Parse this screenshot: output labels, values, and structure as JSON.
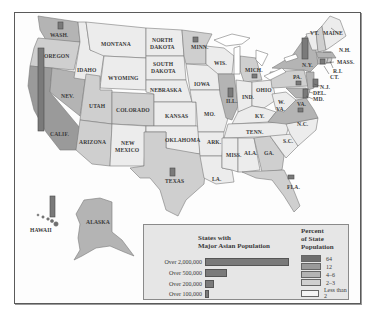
{
  "title": "States with Major Asian Population",
  "colors": {
    "p64": "#6e6e6e",
    "p12": "#9a9a9a",
    "p4_6": "#b4b4b4",
    "p2_3": "#cfcfcf",
    "lt2": "#ececec",
    "bar": "#7a7a7a",
    "border": "#5a5a5a"
  },
  "states": [
    {
      "name": "WASH.",
      "shade": "4-6"
    },
    {
      "name": "OREGON",
      "shade": "2-3"
    },
    {
      "name": "CALIF.",
      "shade": "12"
    },
    {
      "name": "NEV.",
      "shade": "4-6"
    },
    {
      "name": "IDAHO",
      "shade": "Less than 2"
    },
    {
      "name": "MONTANA",
      "shade": "Less than 2"
    },
    {
      "name": "WYOMING",
      "shade": "Less than 2"
    },
    {
      "name": "UTAH",
      "shade": "2-3"
    },
    {
      "name": "COLORADO",
      "shade": "2-3"
    },
    {
      "name": "ARIZONA",
      "shade": "2-3"
    },
    {
      "name": "NEW MEXICO",
      "shade": "Less than 2"
    },
    {
      "name": "NORTH DAKOTA",
      "shade": "Less than 2"
    },
    {
      "name": "SOUTH DAKOTA",
      "shade": "Less than 2"
    },
    {
      "name": "NEBRASKA",
      "shade": "Less than 2"
    },
    {
      "name": "KANSAS",
      "shade": "Less than 2"
    },
    {
      "name": "OKLAHOMA",
      "shade": "Less than 2"
    },
    {
      "name": "TEXAS",
      "shade": "2-3"
    },
    {
      "name": "MINN.",
      "shade": "2-3"
    },
    {
      "name": "IOWA",
      "shade": "Less than 2"
    },
    {
      "name": "MO.",
      "shade": "Less than 2"
    },
    {
      "name": "ARK.",
      "shade": "Less than 2"
    },
    {
      "name": "LA.",
      "shade": "Less than 2"
    },
    {
      "name": "WIS.",
      "shade": "Less than 2"
    },
    {
      "name": "ILL.",
      "shade": "4-6"
    },
    {
      "name": "MICH.",
      "shade": "2-3"
    },
    {
      "name": "IND.",
      "shade": "Less than 2"
    },
    {
      "name": "OHIO",
      "shade": "Less than 2"
    },
    {
      "name": "KY.",
      "shade": "Less than 2"
    },
    {
      "name": "TENN.",
      "shade": "Less than 2"
    },
    {
      "name": "MISS.",
      "shade": "Less than 2"
    },
    {
      "name": "ALA.",
      "shade": "Less than 2"
    },
    {
      "name": "GA.",
      "shade": "2-3"
    },
    {
      "name": "FLA.",
      "shade": "2-3"
    },
    {
      "name": "S.C.",
      "shade": "Less than 2"
    },
    {
      "name": "N.C.",
      "shade": "Less than 2"
    },
    {
      "name": "VA.",
      "shade": "4-6"
    },
    {
      "name": "W. VA.",
      "shade": "Less than 2"
    },
    {
      "name": "PA.",
      "shade": "2-3"
    },
    {
      "name": "N.Y.",
      "shade": "4-6"
    },
    {
      "name": "VT.",
      "shade": "Less than 2"
    },
    {
      "name": "N.H.",
      "shade": "2-3"
    },
    {
      "name": "MAINE",
      "shade": "Less than 2"
    },
    {
      "name": "MASS.",
      "shade": "4-6"
    },
    {
      "name": "R.I.",
      "shade": "2-3"
    },
    {
      "name": "CT.",
      "shade": "2-3"
    },
    {
      "name": "N.J.",
      "shade": "4-6"
    },
    {
      "name": "DEL.",
      "shade": "2-3"
    },
    {
      "name": "MD.",
      "shade": "4-6"
    },
    {
      "name": "ALASKA",
      "shade": "4-6"
    },
    {
      "name": "HAWAII",
      "shade": "64"
    }
  ],
  "population_bars": [
    {
      "state": "CALIF.",
      "size": "Over 2,000,000"
    },
    {
      "state": "N.Y.",
      "size": "Over 500,000"
    },
    {
      "state": "HAWAII",
      "size": "Over 500,000"
    },
    {
      "state": "TEXAS",
      "size": "Over 200,000"
    },
    {
      "state": "ILL.",
      "size": "Over 200,000"
    },
    {
      "state": "N.J.",
      "size": "Over 200,000"
    },
    {
      "state": "WASH.",
      "size": "Over 100,000"
    },
    {
      "state": "MINN.",
      "size": "Over 100,000"
    },
    {
      "state": "MICH.",
      "size": "Over 100,000"
    },
    {
      "state": "PA.",
      "size": "Over 100,000"
    },
    {
      "state": "MASS.",
      "size": "Over 100,000"
    },
    {
      "state": "MD.",
      "size": "Over 200,000"
    },
    {
      "state": "VA.",
      "size": "Over 100,000"
    },
    {
      "state": "FLA.",
      "size": "Over 100,000"
    }
  ],
  "legend": {
    "size_title_1": "States with",
    "size_title_2": "Major Asian Population",
    "sizes": [
      {
        "label": "Over 2,000,000",
        "bar_width": 84
      },
      {
        "label": "Over 500,000",
        "bar_width": 20
      },
      {
        "label": "Over 200,000",
        "bar_width": 8
      },
      {
        "label": "Over 100,000",
        "bar_width": 3
      }
    ],
    "percent_title_1": "Percent",
    "percent_title_2": "of State",
    "percent_title_3": "Population",
    "percent": [
      {
        "label": "64",
        "color": "#6e6e6e"
      },
      {
        "label": "12",
        "color": "#9a9a9a"
      },
      {
        "label": "4–6",
        "color": "#b4b4b4"
      },
      {
        "label": "2–3",
        "color": "#cfcfcf"
      },
      {
        "label": "Less than 2",
        "color": "#f4f4f4"
      }
    ]
  },
  "labels": {
    "wash": "WASH.",
    "oregon": "OREGON",
    "calif": "CALIF.",
    "nev": "NEV.",
    "idaho": "IDAHO",
    "montana": "MONTANA",
    "wyoming": "WYOMING",
    "utah": "UTAH",
    "colorado": "COLORADO",
    "arizona": "ARIZONA",
    "new": "NEW",
    "mexico": "MEXICO",
    "north": "NORTH",
    "dakota": "DAKOTA",
    "south": "SOUTH",
    "nebraska": "NEBRASKA",
    "kansas": "KANSAS",
    "oklahoma": "OKLAHOMA",
    "texas": "TEXAS",
    "minn": "MINN.",
    "iowa": "IOWA",
    "mo": "MO.",
    "ark": "ARK.",
    "la": "LA.",
    "wis": "WIS.",
    "ill": "ILL.",
    "mich": "MICH.",
    "ind": "IND.",
    "ohio": "OHIO",
    "ky": "KY.",
    "tenn": "TENN.",
    "miss": "MISS.",
    "ala": "ALA.",
    "ga": "GA.",
    "fla": "FLA.",
    "sc": "S.C.",
    "nc": "N.C.",
    "va": "VA.",
    "w": "W.",
    "wva": "VA.",
    "pa": "PA.",
    "ny": "N.Y.",
    "vt": "VT.",
    "nh": "N.H.",
    "maine": "MAINE",
    "mass": "MASS.",
    "ri": "R.I.",
    "ct": "CT.",
    "nj": "N.J.",
    "del": "DEL.",
    "md": "MD.",
    "alaska": "ALASKA",
    "hawaii": "HAWAII"
  }
}
